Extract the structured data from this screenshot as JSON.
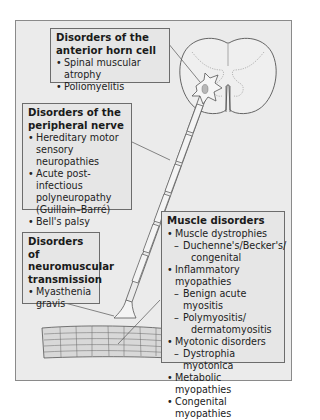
{
  "diagram": {
    "type": "neuromuscular anatomy with disorder classification callouts",
    "colors": {
      "background": "#ebebeb",
      "box_fill": "#e6e6e6",
      "border": "#6c6c6c",
      "nerve_fill": "#f4f4f4",
      "muscle_fill": "#d8d8d8"
    },
    "figures": [
      {
        "name": "spinal-cord-cross-section"
      },
      {
        "name": "motor-neuron-cell-body"
      },
      {
        "name": "myelinated-axon"
      },
      {
        "name": "neuromuscular-junction"
      },
      {
        "name": "muscle-fibre"
      }
    ]
  },
  "boxes": {
    "anterior_horn": {
      "title_line1": "Disorders of the",
      "title_line2": "anterior horn cell",
      "items": [
        "Spinal muscular atrophy",
        "Poliomyelitis"
      ]
    },
    "peripheral_nerve": {
      "title_line1": "Disorders of the",
      "title_line2": "peripheral nerve",
      "items": [
        {
          "line1": "Hereditary motor",
          "line2": "sensory neuropathies"
        },
        {
          "line1": "Acute post-infectious",
          "line2": "polyneuropathy",
          "line3": "(Guillain–Barré)"
        },
        {
          "line1": "Bell's palsy"
        }
      ]
    },
    "neuromuscular": {
      "title_line1": "Disorders of",
      "title_line2": "neuromuscular",
      "title_line3": "transmission",
      "items": [
        {
          "line1": "Myasthenia",
          "line2": "gravis"
        }
      ]
    },
    "muscle": {
      "title": "Muscle disorders",
      "items": [
        {
          "label": "Muscle dystrophies",
          "sub": [
            "Duchenne's/Becker's/",
            "congenital"
          ]
        },
        {
          "label": "Inflammatory myopathies",
          "sub": [
            "Benign acute myositis",
            "Polymyositis/",
            "dermatomyositis"
          ]
        },
        {
          "label": "Myotonic disorders",
          "sub": [
            "Dystrophia myotonica"
          ]
        },
        {
          "label": "Metabolic myopathies"
        },
        {
          "label": "Congenital myopathies"
        }
      ]
    }
  }
}
